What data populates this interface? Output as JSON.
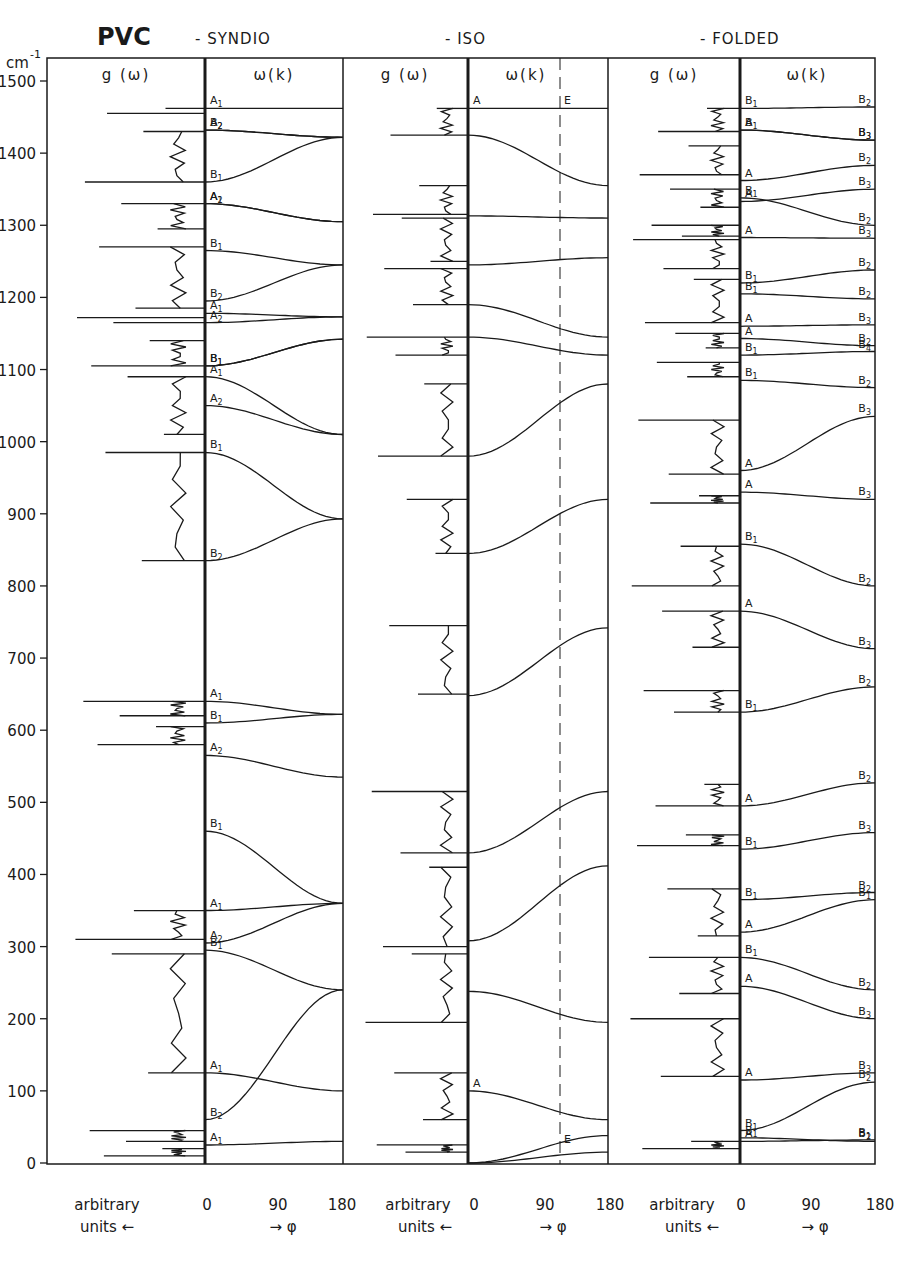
{
  "chart_data": {
    "type": "line",
    "title": "PVC",
    "subtitles": [
      "- SYNDIO",
      "- ISO",
      "- FOLDED"
    ],
    "ylabel": "cm-1",
    "ylim": [
      0,
      1500
    ],
    "yticks": [
      0,
      100,
      200,
      300,
      400,
      500,
      600,
      700,
      800,
      900,
      1000,
      1100,
      1200,
      1300,
      1400,
      1500
    ],
    "grid": false,
    "legend": "none",
    "panels": [
      {
        "name": "SYNDIO",
        "dos_header": "g (ω)",
        "dispersion_header": "ω(k)",
        "dos_xlabel": [
          "arbitrary",
          "units ←"
        ],
        "dispersion_xticks": [
          "0",
          "90",
          "180"
        ],
        "dispersion_xlabel": "→ φ",
        "dos_peaks_cm1": [
          1462,
          1455,
          1430,
          1360,
          1330,
          1295,
          1270,
          1185,
          1172,
          1165,
          1140,
          1105,
          1090,
          1010,
          985,
          835,
          640,
          620,
          605,
          580,
          350,
          310,
          290,
          125,
          45,
          30,
          20,
          10
        ],
        "branches": [
          {
            "label_start": "A1",
            "start": 1462,
            "end": 1462
          },
          {
            "label_start": "A2",
            "start": 1432,
            "end": 1422
          },
          {
            "label_start": "B2",
            "start": 1432,
            "end": 1422
          },
          {
            "label_start": "B1",
            "start": 1360,
            "end": 1422
          },
          {
            "label_start": "A2",
            "start": 1330,
            "end": 1305
          },
          {
            "label_start": "A1",
            "start": 1330,
            "end": 1305
          },
          {
            "label_start": "B1",
            "start": 1265,
            "end": 1245
          },
          {
            "label_start": "B2",
            "start": 1195,
            "end": 1245
          },
          {
            "label_start": "A1",
            "start": 1178,
            "end": 1173
          },
          {
            "label_start": "A2",
            "start": 1165,
            "end": 1173
          },
          {
            "label_start": "B1",
            "start": 1105,
            "end": 1142
          },
          {
            "label_start": "B1",
            "start": 1105,
            "end": 1142
          },
          {
            "label_start": "A1",
            "start": 1090,
            "end": 1010
          },
          {
            "label_start": "A2",
            "start": 1050,
            "end": 1010
          },
          {
            "label_start": "B1",
            "start": 985,
            "end": 893
          },
          {
            "label_start": "B2",
            "start": 835,
            "end": 893
          },
          {
            "label_start": "A1",
            "start": 640,
            "end": 622
          },
          {
            "label_start": "B1",
            "start": 610,
            "end": 622
          },
          {
            "label_start": "A2",
            "start": 565,
            "end": 535
          },
          {
            "label_start": "B1",
            "start": 460,
            "end": 360
          },
          {
            "label_start": "A1",
            "start": 350,
            "end": 360
          },
          {
            "label_start": "A2",
            "start": 305,
            "end": 360
          },
          {
            "label_start": "B1",
            "start": 295,
            "end": 240
          },
          {
            "label_start": "A1",
            "start": 125,
            "end": 100
          },
          {
            "label_start": "B2",
            "start": 60,
            "end": 240
          },
          {
            "label_start": "A1",
            "start": 25,
            "end": 30
          }
        ]
      },
      {
        "name": "ISO",
        "dos_header": "g (ω)",
        "dispersion_header": "ω(k)",
        "dos_xlabel": [
          "arbitrary",
          "units ←"
        ],
        "dispersion_xticks": [
          "0",
          "90",
          "180"
        ],
        "dispersion_xlabel": "→ φ",
        "dashed_marker_phi": 120,
        "marker_labels": [
          "A",
          "E"
        ],
        "dos_peaks_cm1": [
          1462,
          1425,
          1355,
          1315,
          1310,
          1250,
          1240,
          1190,
          1145,
          1120,
          1080,
          980,
          920,
          845,
          745,
          650,
          515,
          430,
          410,
          300,
          290,
          195,
          125,
          60,
          25,
          15
        ],
        "branches": [
          {
            "label_start": "A",
            "label_mid": "E",
            "start": 1462,
            "end": 1462
          },
          {
            "start": 1425,
            "end": 1355
          },
          {
            "start": 1313,
            "end": 1310
          },
          {
            "start": 1245,
            "end": 1255
          },
          {
            "start": 1190,
            "end": 1145
          },
          {
            "start": 1145,
            "end": 1120
          },
          {
            "start": 980,
            "end": 1080
          },
          {
            "start": 845,
            "end": 920
          },
          {
            "start": 648,
            "end": 742
          },
          {
            "start": 430,
            "end": 515
          },
          {
            "start": 308,
            "end": 412
          },
          {
            "start": 238,
            "end": 195
          },
          {
            "label_start": "A",
            "start": 100,
            "end": 60
          },
          {
            "label_mid": "E",
            "start": 0,
            "end": 38
          },
          {
            "start": 0,
            "end": 15
          }
        ]
      },
      {
        "name": "FOLDED",
        "dos_header": "g (ω)",
        "dispersion_header": "ω(k)",
        "dos_xlabel": [
          "arbitrary",
          "units ←"
        ],
        "dispersion_xticks": [
          "0",
          "90",
          "180"
        ],
        "dispersion_xlabel": "→ φ",
        "dos_peaks_cm1": [
          1462,
          1430,
          1410,
          1370,
          1350,
          1325,
          1300,
          1285,
          1280,
          1240,
          1225,
          1165,
          1150,
          1130,
          1110,
          1090,
          1030,
          955,
          925,
          915,
          855,
          800,
          765,
          715,
          655,
          625,
          525,
          495,
          455,
          440,
          380,
          315,
          285,
          235,
          200,
          120,
          30,
          20
        ],
        "branches": [
          {
            "label_start": "B1",
            "label_end": "B2",
            "start": 1462,
            "end": 1464
          },
          {
            "label_start": "A",
            "label_end": "B3",
            "start": 1432,
            "end": 1418
          },
          {
            "label_start": "B1",
            "label_end": "B3",
            "start": 1432,
            "end": 1418
          },
          {
            "label_start": "A",
            "label_end": "B2",
            "start": 1362,
            "end": 1383
          },
          {
            "label_start": "A",
            "label_end": "B3",
            "start": 1333,
            "end": 1350
          },
          {
            "label_start": "B1",
            "label_end": "B2",
            "start": 1338,
            "end": 1300
          },
          {
            "label_start": "A",
            "label_end": "B3",
            "start": 1283,
            "end": 1282
          },
          {
            "label_start": "B1",
            "label_end": "B2",
            "start": 1220,
            "end": 1238
          },
          {
            "label_start": "B1",
            "label_end": "B2",
            "start": 1205,
            "end": 1198
          },
          {
            "label_start": "A",
            "label_end": "B3",
            "start": 1160,
            "end": 1162
          },
          {
            "label_start": "A",
            "label_end": "B2",
            "start": 1143,
            "end": 1133
          },
          {
            "label_start": "B1",
            "label_end": "B4",
            "start": 1120,
            "end": 1125
          },
          {
            "label_start": "B1",
            "label_end": "B2",
            "start": 1085,
            "end": 1075
          },
          {
            "label_start": "A",
            "label_end": "B3",
            "start": 960,
            "end": 1035
          },
          {
            "label_start": "A",
            "label_end": "B3",
            "start": 930,
            "end": 920
          },
          {
            "label_start": "B1",
            "label_end": "B2",
            "start": 858,
            "end": 800
          },
          {
            "label_start": "A",
            "label_end": "B3",
            "start": 765,
            "end": 713
          },
          {
            "label_start": "B1",
            "label_end": "B2",
            "start": 625,
            "end": 660
          },
          {
            "label_start": "A",
            "label_end": "B2",
            "start": 495,
            "end": 527
          },
          {
            "label_start": "B1",
            "label_end": "B3",
            "start": 435,
            "end": 458
          },
          {
            "label_start": "B1",
            "label_end": "B2",
            "start": 365,
            "end": 375
          },
          {
            "label_start": "A",
            "label_end": "B1",
            "start": 320,
            "end": 365
          },
          {
            "label_start": "B1",
            "label_end": "B2",
            "start": 285,
            "end": 240
          },
          {
            "label_start": "A",
            "label_end": "B3",
            "start": 245,
            "end": 200
          },
          {
            "label_start": "A",
            "label_end": "B3",
            "start": 115,
            "end": 125
          },
          {
            "label_start": "B1",
            "label_end": "B2",
            "start": 45,
            "end": 112
          },
          {
            "label_start": "B1",
            "label_end": "B2",
            "start": 35,
            "end": 30
          },
          {
            "label_start": "A",
            "label_end": "B1",
            "start": 30,
            "end": 32
          }
        ]
      }
    ]
  },
  "labels": {
    "title": "PVC",
    "unit": "cm",
    "unit_exp": "-1",
    "sub_syndio": "- SYNDIO",
    "sub_iso": "- ISO",
    "sub_folded": "- FOLDED",
    "g_header": "g (ω)",
    "w_header": "ω(k)",
    "arb": "arbitrary",
    "units": "units ←",
    "x0": "0",
    "x90": "90",
    "x180": "180",
    "phi": "→ φ"
  }
}
